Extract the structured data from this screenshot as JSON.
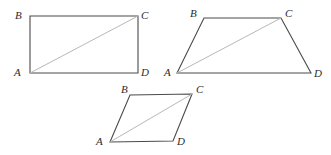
{
  "figure": {
    "canvas": {
      "width": 331,
      "height": 155
    },
    "colors": {
      "background": "#ffffff",
      "outline": "#4a4a4a",
      "diagonal": "#b8b8b8",
      "label": "#2b2b2b"
    },
    "shapes": [
      {
        "name": "rectangle",
        "outline_points": "30,16 138,16 138,73 30,73",
        "diagonal_points": "30,73 138,16",
        "vertices": [
          {
            "id": "A",
            "label": "A",
            "x": 30,
            "y": 73,
            "label_x": 14,
            "label_y": 67
          },
          {
            "id": "B",
            "label": "B",
            "x": 30,
            "y": 16,
            "label_x": 15,
            "label_y": 10
          },
          {
            "id": "C",
            "label": "C",
            "x": 138,
            "y": 16,
            "label_x": 141,
            "label_y": 10
          },
          {
            "id": "D",
            "label": "D",
            "x": 138,
            "y": 73,
            "label_x": 141,
            "label_y": 67
          }
        ]
      },
      {
        "name": "trapezoid",
        "outline_points": "177,73 204,18 281,18 311,73",
        "diagonal_points": "177,73 281,18",
        "vertices": [
          {
            "id": "A",
            "label": "A",
            "x": 177,
            "y": 73,
            "label_x": 164,
            "label_y": 67
          },
          {
            "id": "B",
            "label": "B",
            "x": 204,
            "y": 18,
            "label_x": 190,
            "label_y": 8
          },
          {
            "id": "C",
            "label": "C",
            "x": 281,
            "y": 18,
            "label_x": 285,
            "label_y": 8
          },
          {
            "id": "D",
            "label": "D",
            "x": 311,
            "y": 73,
            "label_x": 314,
            "label_y": 68
          }
        ]
      },
      {
        "name": "parallelogram",
        "outline_points": "110,142 130,95 192,94 173,141",
        "diagonal_points": "110,142 192,94",
        "vertices": [
          {
            "id": "A",
            "label": "A",
            "x": 110,
            "y": 142,
            "label_x": 96,
            "label_y": 136
          },
          {
            "id": "B",
            "label": "B",
            "x": 130,
            "y": 95,
            "label_x": 121,
            "label_y": 84
          },
          {
            "id": "C",
            "label": "C",
            "x": 192,
            "y": 94,
            "label_x": 196,
            "label_y": 84
          },
          {
            "id": "D",
            "label": "D",
            "x": 173,
            "y": 141,
            "label_x": 177,
            "label_y": 136
          }
        ]
      }
    ]
  }
}
